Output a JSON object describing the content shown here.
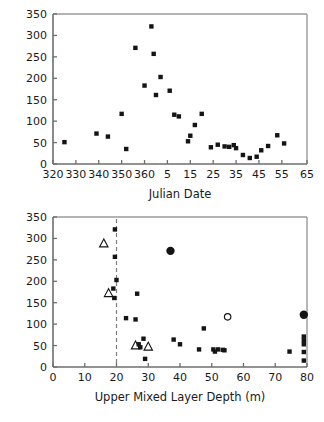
{
  "figure": {
    "shared_y_label_main": "Integrated Upper Mixed Layer Chlorophyll-a (mg m",
    "shared_y_label_exp": "-2",
    "shared_y_label_close": ")"
  },
  "chart_data": [
    {
      "type": "scatter",
      "panel": "top",
      "title": "",
      "xlabel": "Julian Date",
      "ylabel": "Integrated Upper Mixed Layer Chlorophyll-a (mg m-2)",
      "xlim": [
        320,
        431
      ],
      "ylim": [
        0,
        350
      ],
      "yticks": [
        0,
        50,
        100,
        150,
        200,
        250,
        300,
        350
      ],
      "xticks": [
        320,
        330,
        340,
        350,
        360,
        370,
        380,
        390,
        400,
        410,
        420,
        431
      ],
      "xtick_labels": [
        "320",
        "330",
        "340",
        "350",
        "360",
        "5",
        "15",
        "25",
        "35",
        "45",
        "55",
        "65"
      ],
      "grid": false,
      "legend": false,
      "series": [
        {
          "name": "chlorophyll-a",
          "marker": "filled-square",
          "points": [
            [
              325,
              51
            ],
            [
              339,
              71
            ],
            [
              344,
              64
            ],
            [
              350,
              117
            ],
            [
              352,
              35
            ],
            [
              356,
              271
            ],
            [
              360,
              183
            ],
            [
              363,
              321
            ],
            [
              364,
              257
            ],
            [
              365,
              161
            ],
            [
              367,
              203
            ],
            [
              371,
              171
            ],
            [
              373,
              115
            ],
            [
              375,
              111
            ],
            [
              379,
              53
            ],
            [
              380,
              66
            ],
            [
              382,
              91
            ],
            [
              385,
              117
            ],
            [
              389,
              39
            ],
            [
              392,
              45
            ],
            [
              395,
              41
            ],
            [
              397,
              40
            ],
            [
              399,
              44
            ],
            [
              400,
              37
            ],
            [
              403,
              21
            ],
            [
              406,
              14
            ],
            [
              409,
              17
            ],
            [
              411,
              32
            ],
            [
              414,
              42
            ],
            [
              418,
              67
            ],
            [
              421,
              48
            ]
          ]
        }
      ]
    },
    {
      "type": "scatter",
      "panel": "bottom",
      "title": "",
      "xlabel": "Upper Mixed Layer Depth (m)",
      "ylabel": "Integrated Upper Mixed Layer Chlorophyll-a (mg m-2)",
      "xlim": [
        0,
        80
      ],
      "ylim": [
        0,
        350
      ],
      "yticks": [
        0,
        50,
        100,
        150,
        200,
        250,
        300,
        350
      ],
      "xticks": [
        0,
        10,
        20,
        30,
        40,
        50,
        60,
        70,
        80
      ],
      "grid": false,
      "legend": false,
      "reference_line": {
        "orientation": "vertical",
        "x": 20,
        "style": "dashed"
      },
      "series": [
        {
          "name": "small-filled-square",
          "marker": "filled-square",
          "points": [
            [
              19.5,
              321
            ],
            [
              19.5,
              257
            ],
            [
              20.0,
              203
            ],
            [
              19.0,
              183
            ],
            [
              19.3,
              161
            ],
            [
              23.0,
              114
            ],
            [
              26.0,
              111
            ],
            [
              26.5,
              171
            ],
            [
              27.0,
              53
            ],
            [
              28.5,
              66
            ],
            [
              27.5,
              46
            ],
            [
              29.0,
              19
            ],
            [
              38.0,
              64
            ],
            [
              40.0,
              53
            ],
            [
              46.0,
              41
            ],
            [
              47.5,
              90
            ],
            [
              50.5,
              41
            ],
            [
              51.0,
              36
            ],
            [
              52.0,
              41
            ],
            [
              53.5,
              40
            ],
            [
              54.0,
              39
            ],
            [
              74.5,
              36
            ],
            [
              79.0,
              71
            ],
            [
              79.0,
              62
            ],
            [
              79.0,
              53
            ],
            [
              79.0,
              35
            ],
            [
              79.0,
              15
            ]
          ]
        },
        {
          "name": "large-filled-circle",
          "marker": "filled-circle",
          "points": [
            [
              37.0,
              271
            ],
            [
              79.0,
              122
            ]
          ]
        },
        {
          "name": "open-circle",
          "marker": "open-circle",
          "points": [
            [
              55.0,
              117
            ]
          ]
        },
        {
          "name": "open-triangle",
          "marker": "open-triangle",
          "points": [
            [
              16.0,
              288
            ],
            [
              17.5,
              172
            ],
            [
              26.0,
              50
            ],
            [
              30.0,
              47
            ]
          ]
        }
      ]
    }
  ]
}
